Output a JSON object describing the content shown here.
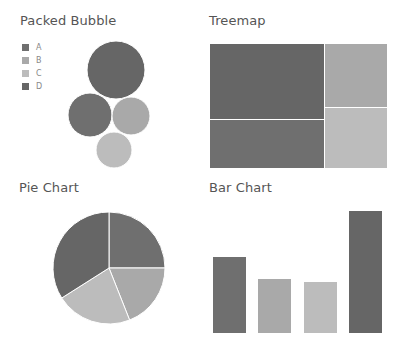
{
  "colors": {
    "A": "#6f6f6f",
    "B": "#a9a9a9",
    "C": "#bcbcbc",
    "D": "#666666"
  },
  "legend": {
    "items": [
      {
        "label": "A",
        "color": "#6f6f6f"
      },
      {
        "label": "B",
        "color": "#a9a9a9"
      },
      {
        "label": "C",
        "color": "#bcbcbc"
      },
      {
        "label": "D",
        "color": "#666666"
      }
    ]
  },
  "titles": {
    "packed_bubble": "Packed Bubble",
    "treemap": "Treemap",
    "pie": "Pie Chart",
    "bar": "Bar Chart"
  },
  "chart_data": [
    {
      "type": "bubble",
      "title": "Packed Bubble",
      "categories": [
        "A",
        "B",
        "C",
        "D"
      ],
      "legend": [
        "A",
        "B",
        "C",
        "D"
      ],
      "legend_position": "left",
      "bubbles": [
        {
          "category": "D",
          "cx": 116,
          "cy": 70,
          "r": 29,
          "color": "#666666"
        },
        {
          "category": "A",
          "cx": 90,
          "cy": 115,
          "r": 22,
          "color": "#6f6f6f"
        },
        {
          "category": "B",
          "cx": 131,
          "cy": 116,
          "r": 19,
          "color": "#a9a9a9"
        },
        {
          "category": "C",
          "cx": 114,
          "cy": 150,
          "r": 18,
          "color": "#bcbcbc"
        }
      ]
    },
    {
      "type": "treemap",
      "title": "Treemap",
      "rects": [
        {
          "category": "D",
          "x": 210,
          "y": 44,
          "w": 114,
          "h": 75,
          "color": "#666666"
        },
        {
          "category": "A",
          "x": 210,
          "y": 120,
          "w": 114,
          "h": 48,
          "color": "#6f6f6f"
        },
        {
          "category": "B",
          "x": 325,
          "y": 44,
          "w": 62,
          "h": 63,
          "color": "#a9a9a9"
        },
        {
          "category": "C",
          "x": 325,
          "y": 108,
          "w": 62,
          "h": 60,
          "color": "#bcbcbc"
        }
      ]
    },
    {
      "type": "pie",
      "title": "Pie Chart",
      "categories": [
        "A",
        "B",
        "C",
        "D"
      ],
      "values": [
        25,
        19,
        22,
        34
      ],
      "colors": [
        "#6f6f6f",
        "#a9a9a9",
        "#bcbcbc",
        "#666666"
      ],
      "center": [
        109,
        268
      ],
      "radius": 56
    },
    {
      "type": "bar",
      "title": "Bar Chart",
      "categories": [
        "A",
        "B",
        "C",
        "D"
      ],
      "values": [
        76,
        54,
        51,
        122
      ],
      "colors": [
        "#6f6f6f",
        "#a9a9a9",
        "#bcbcbc",
        "#666666"
      ],
      "xlabel": "",
      "ylabel": "",
      "grid": false
    }
  ]
}
